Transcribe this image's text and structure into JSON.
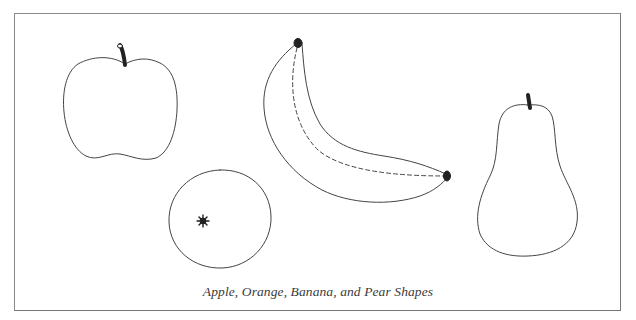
{
  "figure": {
    "caption": "Apple, Orange, Banana, and Pear Shapes",
    "shapes": [
      {
        "name": "Apple"
      },
      {
        "name": "Orange"
      },
      {
        "name": "Banana"
      },
      {
        "name": "Pear"
      }
    ],
    "colors": {
      "outline": "#444444",
      "stem": "#222222",
      "border": "#8a8a8a",
      "background": "#ffffff"
    }
  }
}
